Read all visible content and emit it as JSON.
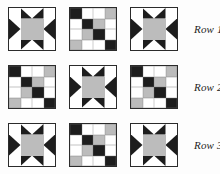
{
  "figure": {
    "colors": {
      "dark": "#1d1d1d",
      "gray": "#bcbcbc",
      "white": "#ffffff",
      "outline": "#2b2b2b",
      "background": "#fdfdfd",
      "label_text": "#1e1e1e"
    },
    "block_types": {
      "star": "sawtooth-star-block",
      "patch": "four-by-four-patch-block"
    }
  },
  "rows": [
    {
      "label": "Row 1",
      "blocks": [
        {
          "type": "star",
          "name": "star-block"
        },
        {
          "type": "patch",
          "name": "patch-block"
        },
        {
          "type": "star",
          "name": "star-block"
        }
      ]
    },
    {
      "label": "Row 2",
      "blocks": [
        {
          "type": "patch",
          "name": "patch-block"
        },
        {
          "type": "star",
          "name": "star-block"
        },
        {
          "type": "patch",
          "name": "patch-block"
        }
      ]
    },
    {
      "label": "Row 3",
      "blocks": [
        {
          "type": "star",
          "name": "star-block"
        },
        {
          "type": "patch",
          "name": "patch-block"
        },
        {
          "type": "star",
          "name": "star-block"
        }
      ]
    }
  ],
  "star_block": {
    "grid": "3x3",
    "cells": [
      "white",
      "geese-top",
      "white",
      "geese-left",
      "gray",
      "geese-right",
      "white",
      "geese-bottom",
      "white"
    ]
  },
  "patch_block": {
    "grid": "4x4",
    "cells": [
      "d",
      "w",
      "w",
      "g",
      "w",
      "d",
      "g",
      "w",
      "w",
      "g",
      "d",
      "w",
      "g",
      "w",
      "w",
      "d"
    ]
  }
}
